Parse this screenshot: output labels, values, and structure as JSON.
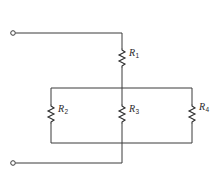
{
  "diagram": {
    "type": "circuit-schematic",
    "colors": {
      "line": "#3a3a3a",
      "background": "#ffffff"
    },
    "terminals": [
      {
        "id": "terminal-top",
        "x": 13,
        "y": 33
      },
      {
        "id": "terminal-bottom",
        "x": 13,
        "y": 163
      }
    ],
    "resistors": [
      {
        "id": "R1",
        "letter": "R",
        "subscript": "1",
        "x": 122,
        "y_top": 48,
        "y_bottom": 66
      },
      {
        "id": "R2",
        "letter": "R",
        "subscript": "2",
        "x": 51,
        "y_top": 104,
        "y_bottom": 122
      },
      {
        "id": "R3",
        "letter": "R",
        "subscript": "3",
        "x": 122,
        "y_top": 104,
        "y_bottom": 122
      },
      {
        "id": "R4",
        "letter": "R",
        "subscript": "4",
        "x": 192,
        "y_top": 104,
        "y_bottom": 122
      }
    ],
    "connections": [
      "terminal-top -> R1",
      "R1 -> top-bus",
      "top-bus -> R2, R3, R4",
      "R2, R3, R4 -> bottom-bus",
      "bottom-bus -> terminal-bottom"
    ]
  }
}
